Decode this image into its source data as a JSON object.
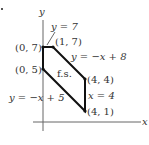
{
  "diagram": {
    "type": "feasible-region",
    "axes": {
      "x_label": "x",
      "y_label": "y"
    },
    "region_label": "f.s.",
    "vertices": [
      {
        "label": "(0, 7)",
        "x": 0,
        "y": 7
      },
      {
        "label": "(1, 7)",
        "x": 1,
        "y": 7
      },
      {
        "label": "(4, 4)",
        "x": 4,
        "y": 4
      },
      {
        "label": "(4, 1)",
        "x": 4,
        "y": 1
      },
      {
        "label": "(0, 5)",
        "x": 0,
        "y": 5
      }
    ],
    "boundary_lines": [
      {
        "label": "y = 7"
      },
      {
        "label": "y = −x + 8"
      },
      {
        "label": "x = 4"
      },
      {
        "label": "y = −x + 5"
      }
    ],
    "colors": {
      "boundary": "#111111",
      "axis": "#555555",
      "text": "#333333"
    }
  }
}
